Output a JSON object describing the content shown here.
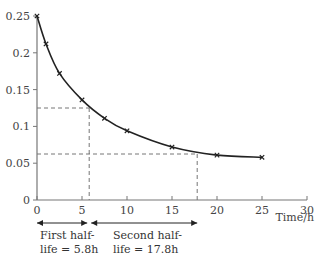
{
  "chart_data": {
    "type": "line",
    "title": "",
    "xlabel": "Time/h",
    "ylabel": "",
    "xlim": [
      0,
      30
    ],
    "ylim": [
      0,
      0.25
    ],
    "grid": false,
    "x_ticks": [
      "0",
      "5",
      "10",
      "15",
      "20",
      "25",
      "30"
    ],
    "y_ticks": [
      "0",
      "0.05",
      "0.1",
      "0.15",
      "0.2",
      "0.25"
    ],
    "series": [
      {
        "name": "concentration",
        "marker": "x",
        "x": [
          0,
          1,
          2.5,
          5,
          7.5,
          10,
          15,
          20,
          25
        ],
        "values": [
          0.25,
          0.212,
          0.172,
          0.136,
          0.111,
          0.094,
          0.072,
          0.061,
          0.058
        ]
      }
    ],
    "reference_lines": [
      {
        "type": "horizontal",
        "y": 0.125,
        "x_end": 5.8,
        "style": "dashed"
      },
      {
        "type": "vertical",
        "x": 5.8,
        "y_end": 0.125,
        "style": "dashed"
      },
      {
        "type": "horizontal",
        "y": 0.0625,
        "x_end": 17.8,
        "style": "dashed"
      },
      {
        "type": "vertical",
        "x": 17.8,
        "y_end": 0.0625,
        "style": "dashed"
      }
    ],
    "annotations": [
      {
        "text_line1": "First half-",
        "text_line2": "life = 5.8h",
        "from": 0,
        "to": 5.8
      },
      {
        "text_line1": "Second half-",
        "text_line2": "life = 17.8h",
        "from": 5.8,
        "to": 17.8
      }
    ]
  },
  "layout": {
    "origin_px": [
      37,
      200
    ],
    "px_per_x_unit": 9,
    "px_per_y_unit": 736,
    "line_color": "#222222",
    "axis_color": "#777777",
    "dash_color": "#666666"
  }
}
